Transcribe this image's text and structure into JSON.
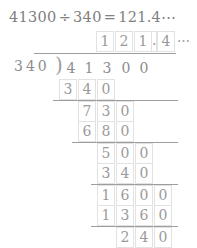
{
  "equation": {
    "dividend": "41300",
    "divide_symbol": "÷",
    "divisor": "340",
    "equals_symbol": "=",
    "result": "121.4",
    "ellipsis": "⋯"
  },
  "quotient": {
    "digits": [
      "1",
      "2",
      "1",
      "4"
    ],
    "decimal_point": ".",
    "ellipsis": "⋯"
  },
  "division": {
    "divisor_digits": [
      "3",
      "4",
      "0"
    ],
    "bracket_symbol": ")",
    "dividend_digits": [
      "4",
      "1",
      "3",
      "0",
      "0"
    ]
  },
  "work_rows": [
    {
      "label": "subtract-340",
      "digits": [
        "3",
        "4",
        "0"
      ]
    },
    {
      "label": "remainder-730",
      "digits": [
        "7",
        "3",
        "0"
      ]
    },
    {
      "label": "subtract-680",
      "digits": [
        "6",
        "8",
        "0"
      ]
    },
    {
      "label": "remainder-500",
      "digits": [
        "5",
        "0",
        "0"
      ]
    },
    {
      "label": "subtract-340",
      "digits": [
        "3",
        "4",
        "0"
      ]
    },
    {
      "label": "remainder-1600",
      "digits": [
        "1",
        "6",
        "0",
        "0"
      ]
    },
    {
      "label": "subtract-1360",
      "digits": [
        "1",
        "3",
        "6",
        "0"
      ]
    },
    {
      "label": "remainder-240",
      "digits": [
        "2",
        "4",
        "0"
      ]
    }
  ],
  "colors": {
    "ink": "#9a9a9a",
    "rule": "#9e9e9e",
    "cell_border": "#e2e2e2",
    "background": "#ffffff"
  }
}
